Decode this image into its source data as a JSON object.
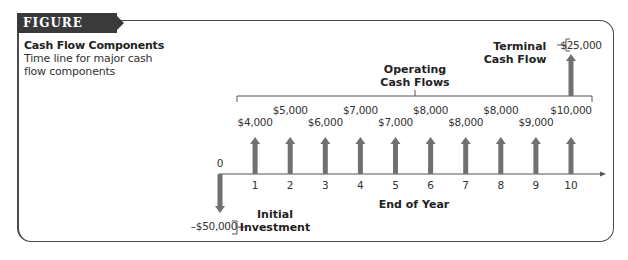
{
  "figure": {
    "label": "FIGURE 11.1",
    "title": "Cash Flow Components",
    "subtitle": "Time line for major cash flow components"
  },
  "diagram": {
    "operating_label_line1": "Operating",
    "operating_label_line2": "Cash Flows",
    "terminal_label_line1": "Terminal",
    "terminal_label_line2": "Cash Flow",
    "terminal_value": "$25,000",
    "initial_label_line1": "Initial",
    "initial_label_line2": "Investment",
    "initial_value": "–$50,000",
    "axis_label": "End of Year",
    "zero_label": "0",
    "colors": {
      "arrow": "#707070",
      "axis": "#555555",
      "frame": "#4a4a4a",
      "tag": "#3a3a3a"
    }
  },
  "chart_data": {
    "type": "timeline",
    "title": "Cash Flow Components",
    "xlabel": "End of Year",
    "years": [
      0,
      1,
      2,
      3,
      4,
      5,
      6,
      7,
      8,
      9,
      10
    ],
    "initial_investment": {
      "year": 0,
      "value": -50000,
      "label": "–$50,000"
    },
    "operating_cash_flows": [
      {
        "year": 1,
        "value": 4000,
        "label": "$4,000"
      },
      {
        "year": 2,
        "value": 5000,
        "label": "$5,000"
      },
      {
        "year": 3,
        "value": 6000,
        "label": "$6,000"
      },
      {
        "year": 4,
        "value": 7000,
        "label": "$7,000"
      },
      {
        "year": 5,
        "value": 7000,
        "label": "$7,000"
      },
      {
        "year": 6,
        "value": 8000,
        "label": "$8,000"
      },
      {
        "year": 7,
        "value": 8000,
        "label": "$8,000"
      },
      {
        "year": 8,
        "value": 8000,
        "label": "$8,000"
      },
      {
        "year": 9,
        "value": 9000,
        "label": "$9,000"
      },
      {
        "year": 10,
        "value": 10000,
        "label": "$10,000"
      }
    ],
    "terminal_cash_flow": {
      "year": 10,
      "value": 25000,
      "label": "$25,000"
    }
  }
}
